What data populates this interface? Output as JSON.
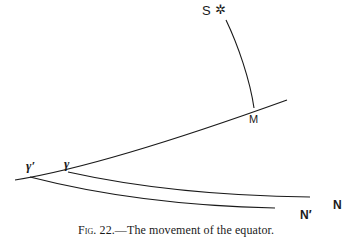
{
  "figure": {
    "caption_prefix": "Fig. 22.",
    "caption_text": "—The movement of the equator.",
    "labels": {
      "star": "S",
      "star_symbol": "✲",
      "meridian_point": "M",
      "gamma": "γ",
      "gamma_prime": "γ′",
      "north": "N",
      "north_prime": "N′"
    },
    "line_color": "#1a1a1a"
  }
}
